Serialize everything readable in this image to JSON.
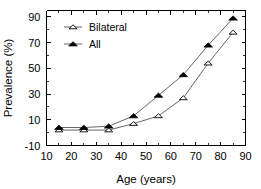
{
  "chart_data": {
    "type": "line",
    "title": "",
    "subtitle": "",
    "xlabel": "Age (years)",
    "ylabel": "Prevalence (%)",
    "xlim": [
      10,
      90
    ],
    "ylim": [
      -10,
      95
    ],
    "x_ticks": [
      10,
      20,
      30,
      40,
      50,
      60,
      70,
      80,
      90
    ],
    "x_tick_labels": [
      "10",
      "20",
      "30",
      "40",
      "50",
      "60",
      "70",
      "80",
      "90"
    ],
    "y_ticks": [
      -10,
      10,
      30,
      50,
      70,
      90
    ],
    "y_tick_labels": [
      "-10",
      "10",
      "30",
      "50",
      "70",
      "90"
    ],
    "x": [
      15,
      25,
      35,
      45,
      55,
      65,
      75,
      85
    ],
    "grid": false,
    "legend_position": "upper left",
    "series": [
      {
        "name": "Bilateral",
        "marker": "open-triangle",
        "color": "#000000",
        "values": [
          2,
          2,
          2,
          7,
          13,
          27,
          54,
          78
        ]
      },
      {
        "name": "All",
        "marker": "filled-triangle",
        "color": "#000000",
        "values": [
          4,
          4,
          5,
          13,
          29,
          45,
          68,
          89
        ]
      }
    ],
    "annotations": []
  },
  "axes": {
    "x_title": "Age (years)",
    "y_title": "Prevalence (%)"
  },
  "legend": {
    "entries": [
      {
        "label": "Bilateral"
      },
      {
        "label": "All"
      }
    ]
  },
  "colors": {
    "axis": "#000000",
    "line": "#555555",
    "marker_fill_all": "#000000",
    "marker_fill_bilateral": "#ffffff",
    "background": "#ffffff"
  }
}
